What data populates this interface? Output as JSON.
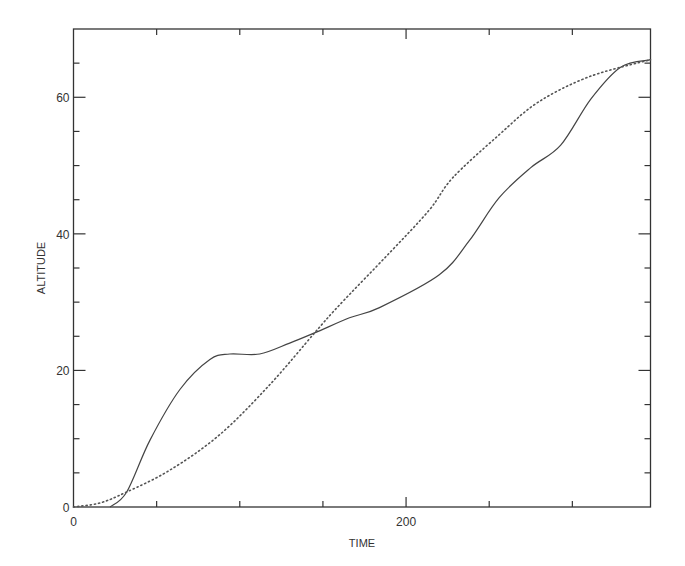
{
  "chart_data": {
    "type": "line",
    "title": "",
    "xlabel": "TIME",
    "ylabel": "ALTITUDE",
    "xlim": [
      0,
      347
    ],
    "ylim": [
      0,
      70
    ],
    "grid": false,
    "legend": null,
    "x_major_ticks": [
      0,
      200
    ],
    "x_minor_ticks": [
      50,
      100,
      150,
      250,
      300
    ],
    "y_major_ticks": [
      0,
      20,
      40,
      60
    ],
    "y_minor_ticks": [
      5,
      10,
      15,
      25,
      30,
      35,
      45,
      50,
      55,
      65
    ],
    "x_tick_labels": [
      "0",
      "200"
    ],
    "y_tick_labels": [
      "0",
      "20",
      "40",
      "60"
    ],
    "series": [
      {
        "name": "solid",
        "style": "solid",
        "x": [
          22,
          32,
          46,
          64,
          82,
          94,
          112,
          130,
          145,
          166,
          184,
          220,
          238,
          256,
          275,
          293,
          311,
          329,
          347
        ],
        "y": [
          0,
          2.2,
          9.8,
          17.2,
          21.6,
          22.4,
          22.4,
          24,
          25.5,
          27.7,
          29.2,
          34,
          39,
          45.3,
          49.7,
          53,
          59.7,
          64.4,
          65.5
        ]
      },
      {
        "name": "dotted",
        "style": "dotted",
        "x": [
          0,
          16,
          32,
          58,
          88,
          118,
          145,
          160,
          190,
          214,
          228,
          255,
          279,
          310,
          347
        ],
        "y": [
          0,
          0.6,
          2.2,
          5.4,
          10.6,
          17.9,
          25.5,
          29.6,
          37.2,
          43.5,
          48.2,
          54.3,
          59.2,
          63,
          65.5
        ]
      }
    ]
  }
}
